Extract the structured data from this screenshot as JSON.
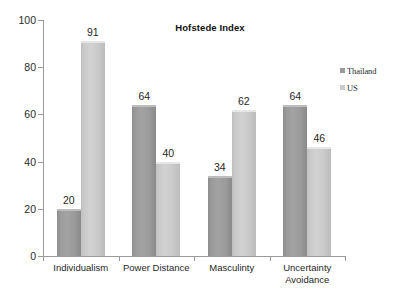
{
  "chart_data": {
    "type": "bar",
    "title": "Hofstede Index",
    "xlabel": "",
    "ylabel": "",
    "ylim": [
      0,
      100
    ],
    "yticks": [
      0,
      20,
      40,
      60,
      80,
      100
    ],
    "grid": false,
    "legend_position": "right",
    "categories": [
      "Individualism",
      "Power Distance",
      "Masculinty",
      "Uncertainty\nAvoidance"
    ],
    "series": [
      {
        "name": "Thailand",
        "color": "#9a9a9a",
        "values": [
          20,
          64,
          34,
          64
        ],
        "labels": [
          "20",
          "64",
          "34",
          "64"
        ]
      },
      {
        "name": "US",
        "color": "#cbcbcb",
        "values": [
          91,
          40,
          62,
          46
        ],
        "labels": [
          "91",
          "40",
          "62",
          "46"
        ]
      }
    ]
  },
  "axis": {
    "y_tick_labels": [
      "100",
      "80",
      "60",
      "40",
      "20",
      "0"
    ]
  },
  "legend": {
    "items": [
      {
        "label": "Thailand",
        "swatch": "legend-swatch-thailand"
      },
      {
        "label": "US",
        "swatch": "legend-swatch-us"
      }
    ]
  }
}
